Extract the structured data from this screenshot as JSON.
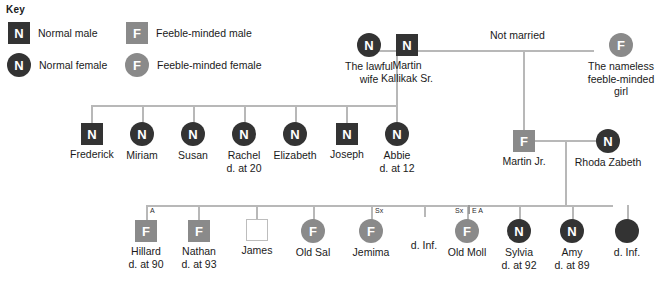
{
  "key": {
    "title": "Key",
    "entries": [
      {
        "glyph": "N",
        "shape": "square",
        "tone": "dark",
        "label": "Normal male"
      },
      {
        "glyph": "F",
        "shape": "square",
        "tone": "grey",
        "label": "Feeble-minded male"
      },
      {
        "glyph": "N",
        "shape": "circle",
        "tone": "dark",
        "label": "Normal female"
      },
      {
        "glyph": "F",
        "shape": "circle",
        "tone": "grey",
        "label": "Feeble-minded female"
      }
    ]
  },
  "colors": {
    "normal": "#333333",
    "feeble_minded": "#8a8a8a",
    "line": "#b8b8b8",
    "background": "#ffffff",
    "text": "#1a1a1a"
  },
  "annotations": {
    "not_married": "Not married"
  },
  "generation1": [
    {
      "id": "lawful-wife",
      "glyph": "N",
      "shape": "circle",
      "tone": "dark",
      "name": "The lawful",
      "name2": "wife",
      "note": ""
    },
    {
      "id": "martin-sr",
      "glyph": "N",
      "shape": "square",
      "tone": "dark",
      "name": "Martin",
      "name2": "Kallikak Sr.",
      "note": ""
    },
    {
      "id": "nameless-girl",
      "glyph": "F",
      "shape": "circle",
      "tone": "grey",
      "name": "The nameless",
      "name2": "feeble-minded",
      "name3": "girl",
      "note": ""
    }
  ],
  "generation2": [
    {
      "id": "frederick",
      "glyph": "N",
      "shape": "square",
      "tone": "dark",
      "name": "Frederick",
      "note": ""
    },
    {
      "id": "miriam",
      "glyph": "N",
      "shape": "circle",
      "tone": "dark",
      "name": "Miriam",
      "note": ""
    },
    {
      "id": "susan",
      "glyph": "N",
      "shape": "circle",
      "tone": "dark",
      "name": "Susan",
      "note": ""
    },
    {
      "id": "rachel",
      "glyph": "N",
      "shape": "circle",
      "tone": "dark",
      "name": "Rachel",
      "note": "d. at 20"
    },
    {
      "id": "elizabeth",
      "glyph": "N",
      "shape": "circle",
      "tone": "dark",
      "name": "Elizabeth",
      "note": ""
    },
    {
      "id": "joseph",
      "glyph": "N",
      "shape": "square",
      "tone": "dark",
      "name": "Joseph",
      "note": ""
    },
    {
      "id": "abbie",
      "glyph": "N",
      "shape": "circle",
      "tone": "dark",
      "name": "Abbie",
      "note": "d. at 12"
    },
    {
      "id": "martin-jr",
      "glyph": "F",
      "shape": "square",
      "tone": "grey",
      "name": "Martin Jr.",
      "note": ""
    },
    {
      "id": "rhoda-zabeth",
      "glyph": "N",
      "shape": "circle",
      "tone": "dark",
      "name": "Rhoda Zabeth",
      "note": ""
    }
  ],
  "generation3": [
    {
      "id": "hillard",
      "glyph": "F",
      "shape": "square",
      "tone": "grey",
      "name": "Hillard",
      "note": "d. at 90",
      "tag": "A"
    },
    {
      "id": "nathan",
      "glyph": "F",
      "shape": "square",
      "tone": "grey",
      "name": "Nathan",
      "note": "d. at 93",
      "tag": ""
    },
    {
      "id": "james",
      "glyph": "",
      "shape": "square",
      "tone": "empty",
      "name": "James",
      "note": "",
      "tag": ""
    },
    {
      "id": "old-sal",
      "glyph": "F",
      "shape": "circle",
      "tone": "grey",
      "name": "Old Sal",
      "note": "",
      "tag": ""
    },
    {
      "id": "jemima",
      "glyph": "F",
      "shape": "circle",
      "tone": "grey",
      "name": "Jemima",
      "note": "",
      "tag": "Sx"
    },
    {
      "id": "d-inf-1",
      "glyph": "",
      "shape": "none",
      "tone": "none",
      "name": "d. Inf.",
      "note": "",
      "tag": ""
    },
    {
      "id": "old-moll",
      "glyph": "F",
      "shape": "circle",
      "tone": "grey",
      "name": "Old Moll",
      "note": "",
      "tag": "Sx",
      "tag2": "E A"
    },
    {
      "id": "sylvia",
      "glyph": "N",
      "shape": "circle",
      "tone": "dark",
      "name": "Sylvia",
      "note": "d. at 92",
      "tag": ""
    },
    {
      "id": "amy",
      "glyph": "N",
      "shape": "circle",
      "tone": "dark",
      "name": "Amy",
      "note": "d. at 89",
      "tag": ""
    },
    {
      "id": "d-inf-2",
      "glyph": "",
      "shape": "circle",
      "tone": "dark",
      "name": "d. Inf.",
      "note": "",
      "tag": ""
    }
  ]
}
